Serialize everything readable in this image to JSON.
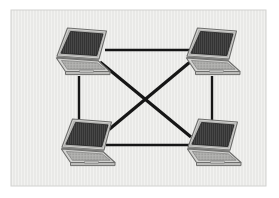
{
  "figure": {
    "title": "Mesh network topology diagram",
    "canvas": {
      "width": 279,
      "height": 198
    },
    "colors": {
      "page_background": "#ffffff",
      "panel_background": "#e8e8e6",
      "panel_stripe": "#f1f1ef",
      "panel_border": "#d2d2d0",
      "link_line": "#161616",
      "laptop_screen": "#343434",
      "laptop_screen_stripe": "#4a4a4a",
      "laptop_bezel": "#b9b9b7",
      "laptop_bezel_highlight": "#d9d9d7",
      "laptop_bezel_shadow": "#8e8e8c",
      "laptop_base": "#cfcfcd",
      "laptop_base_edge": "#7e7e7c",
      "laptop_keyboard": "#a9a9a7",
      "laptop_trackpad": "#bdbdbb"
    }
  },
  "panel": {
    "name": "diagram-panel",
    "x": 11,
    "y": 10,
    "width": 255,
    "height": 176
  },
  "nodes": [
    {
      "id": "node-top-left",
      "label": "Laptop top left",
      "x": 49,
      "y": 26,
      "width": 62,
      "height": 53,
      "port_x": 79,
      "port_y": 77
    },
    {
      "id": "node-top-right",
      "label": "Laptop top right",
      "x": 179,
      "y": 26,
      "width": 62,
      "height": 53,
      "port_x": 209,
      "port_y": 77
    },
    {
      "id": "node-bottom-left",
      "label": "Laptop bottom left",
      "x": 54,
      "y": 117,
      "width": 62,
      "height": 53,
      "port_x": 84,
      "port_y": 120
    },
    {
      "id": "node-bottom-right",
      "label": "Laptop bottom right",
      "x": 180,
      "y": 117,
      "width": 62,
      "height": 53,
      "port_x": 210,
      "port_y": 120
    }
  ],
  "links": [
    {
      "id": "link-top",
      "from": "node-top-left",
      "to": "node-top-right",
      "x1": 105,
      "y1": 50,
      "x2": 189,
      "y2": 50,
      "width": 2.4
    },
    {
      "id": "link-left",
      "from": "node-top-left",
      "to": "node-bottom-left",
      "x1": 79,
      "y1": 76,
      "x2": 79,
      "y2": 127,
      "width": 2.4
    },
    {
      "id": "link-right",
      "from": "node-top-right",
      "to": "node-bottom-right",
      "x1": 212,
      "y1": 76,
      "x2": 212,
      "y2": 127,
      "width": 2.4
    },
    {
      "id": "link-bottom",
      "from": "node-bottom-left",
      "to": "node-bottom-right",
      "x1": 106,
      "y1": 145,
      "x2": 190,
      "y2": 145,
      "width": 2.4
    },
    {
      "id": "link-diagonal-nw-se",
      "from": "node-top-left",
      "to": "node-bottom-right",
      "x1": 100,
      "y1": 62,
      "x2": 191,
      "y2": 137,
      "width": 3.2
    },
    {
      "id": "link-diagonal-ne-sw",
      "from": "node-top-right",
      "to": "node-bottom-left",
      "x1": 190,
      "y1": 62,
      "x2": 100,
      "y2": 137,
      "width": 3.2
    }
  ]
}
